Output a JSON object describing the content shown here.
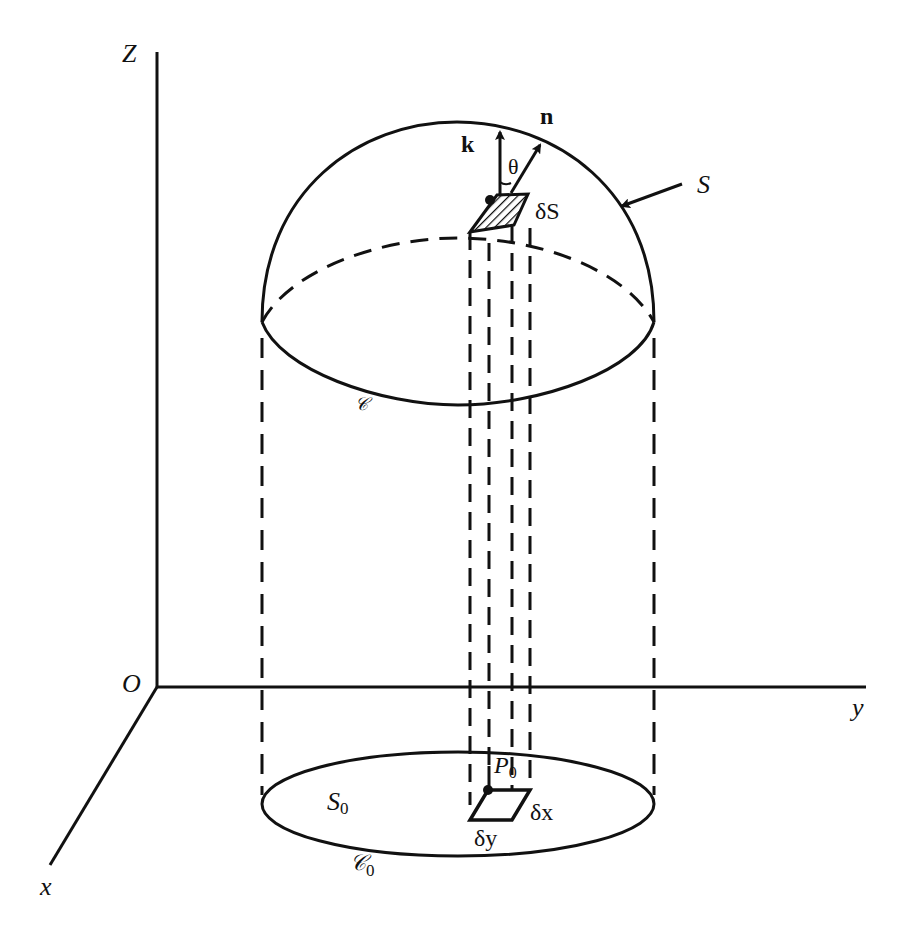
{
  "figure": {
    "axes": {
      "z_label": "Z",
      "y_label": "y",
      "x_label": "x",
      "origin_label": "O"
    },
    "surface": {
      "surface_label": "S",
      "boundary_label": "𝒞",
      "element_label": "δS",
      "k_label": "k",
      "n_label": "n",
      "angle_label": "θ"
    },
    "projection": {
      "region_label": "S",
      "region_subscript": "0",
      "boundary_label": "𝒞",
      "boundary_subscript": "0",
      "point_label": "P",
      "point_subscript": "0",
      "dx_label": "δx",
      "dy_label": "δy"
    },
    "colors": {
      "ink": "#111111",
      "background": "#ffffff"
    }
  }
}
